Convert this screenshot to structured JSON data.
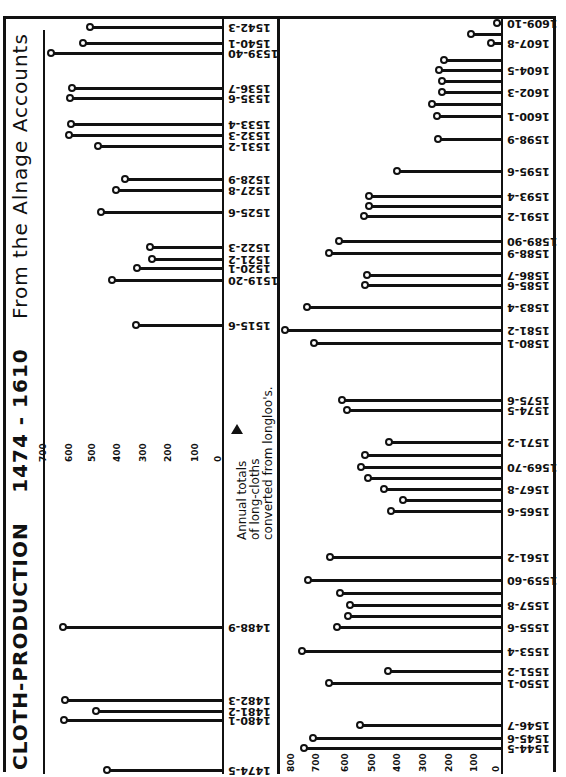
{
  "title": {
    "main": "CLOTH-PRODUCTION",
    "years": "1474 - 1610",
    "source": "From the Alnage Accounts"
  },
  "annotation": {
    "line1": "Annual totals",
    "line2": "of long-cloths",
    "line3": "converted from longloo's."
  },
  "chart_data": [
    {
      "type": "bar",
      "orientation": "lollipop, rotated 90°",
      "title": "CLOTH-PRODUCTION 1474-1610 From the Alnage Accounts",
      "panel": "left (1474-1543)",
      "xlabel": "",
      "ylabel": "Annual totals of long-cloths converted from longloo's",
      "ylim": [
        0,
        700
      ],
      "ticks": [
        "0",
        "100",
        "200",
        "300",
        "400",
        "500",
        "600",
        "700"
      ],
      "grid": false,
      "categories": [
        "1474-5",
        "1480-1",
        "1481-2",
        "1482-3",
        "1488-9",
        "1515-6",
        "1519-20",
        "1520-1",
        "1521-2",
        "1522-3",
        "1525-6",
        "1527-8",
        "1528-9",
        "1531-2",
        "1532-3",
        "1533-4",
        "1535-6",
        "1536-7",
        "1539-40",
        "1540-1",
        "1542-3"
      ],
      "values": [
        452,
        624,
        496,
        620,
        628,
        336,
        432,
        332,
        272,
        280,
        476,
        416,
        380,
        488,
        604,
        596,
        600,
        592,
        676,
        548,
        520
      ]
    },
    {
      "type": "bar",
      "orientation": "lollipop, rotated 90°",
      "panel": "right (1544-1610)",
      "ylim": [
        0,
        800
      ],
      "ticks": [
        "0",
        "100",
        "200",
        "300",
        "400",
        "500",
        "600",
        "700",
        "800"
      ],
      "grid": false,
      "categories": [
        "1544-5",
        "1545-6",
        "1546-7",
        "1550-1",
        "1551-2",
        "1553-4",
        "1555-6",
        "1556-7",
        "1557-8",
        "1558-9",
        "1559-60",
        "1561-2",
        "1565-6",
        "1566-7",
        "1567-8",
        "1568-9",
        "1569-70",
        "1570-1",
        "1571-2",
        "1574-5",
        "1575-6",
        "1580-1",
        "1581-2",
        "1583-4",
        "1585-6",
        "1586-7",
        "1588-9",
        "1589-90",
        "1591-2",
        "1592-3",
        "1593-4",
        "1595-6",
        "1598-9",
        "1600-1",
        "1601-2",
        "1602-3",
        "1603-4",
        "1604-5",
        "1606-7",
        "1607-8",
        "1608-9",
        "1609-10"
      ],
      "values": [
        755,
        715,
        535,
        655,
        425,
        760,
        625,
        580,
        575,
        610,
        735,
        650,
        415,
        365,
        440,
        505,
        530,
        515,
        420,
        585,
        605,
        715,
        825,
        740,
        515,
        505,
        655,
        615,
        520,
        500,
        500,
        390,
        230,
        235,
        255,
        215,
        215,
        225,
        205,
        25,
        100,
        5
      ]
    }
  ],
  "left_panel": {
    "ticks": [
      "700",
      "600",
      "500",
      "400",
      "300",
      "200",
      "100",
      "0"
    ],
    "rows": [
      {
        "label": "1542-3",
        "y": 27,
        "x": 90
      },
      {
        "label": "1540-1",
        "y": 43,
        "x": 83
      },
      {
        "label": "1539-40",
        "y": 53,
        "x": 51
      },
      {
        "label": "1536-7",
        "y": 88,
        "x": 72
      },
      {
        "label": "1535-6",
        "y": 98,
        "x": 70
      },
      {
        "label": "1533-4",
        "y": 124,
        "x": 71
      },
      {
        "label": "1532-3",
        "y": 135,
        "x": 69
      },
      {
        "label": "1531-2",
        "y": 146,
        "x": 98
      },
      {
        "label": "1528-9",
        "y": 179,
        "x": 125
      },
      {
        "label": "1527-8",
        "y": 190,
        "x": 116
      },
      {
        "label": "1525-6",
        "y": 212,
        "x": 101
      },
      {
        "label": "1522-3",
        "y": 247,
        "x": 150
      },
      {
        "label": "1521-2",
        "y": 259,
        "x": 152
      },
      {
        "label": "1520-1",
        "y": 268,
        "x": 137
      },
      {
        "label": "1519-20",
        "y": 280,
        "x": 112
      },
      {
        "label": "1515-6",
        "y": 325,
        "x": 136
      },
      {
        "label": "1488-9",
        "y": 627,
        "x": 63
      },
      {
        "label": "1482-3",
        "y": 700,
        "x": 65
      },
      {
        "label": "1481-2",
        "y": 711,
        "x": 96
      },
      {
        "label": "1480-1",
        "y": 720,
        "x": 64
      },
      {
        "label": "1474-5",
        "y": 770,
        "x": 107
      }
    ]
  },
  "right_panel": {
    "ticks": [
      "800",
      "700",
      "600",
      "500",
      "400",
      "300",
      "200",
      "100",
      "0"
    ],
    "rows": [
      {
        "label": "1609-10",
        "y": 23,
        "x": 497
      },
      {
        "label": "",
        "y": 34,
        "x": 471
      },
      {
        "label": "1607-8",
        "y": 43,
        "x": 491
      },
      {
        "label": "",
        "y": 60,
        "x": 444
      },
      {
        "label": "1604-5",
        "y": 70,
        "x": 439
      },
      {
        "label": "",
        "y": 81,
        "x": 442
      },
      {
        "label": "1602-3",
        "y": 92,
        "x": 442
      },
      {
        "label": "",
        "y": 104,
        "x": 432
      },
      {
        "label": "1600-1",
        "y": 116,
        "x": 437
      },
      {
        "label": "1598-9",
        "y": 139,
        "x": 438
      },
      {
        "label": "1595-6",
        "y": 171,
        "x": 397
      },
      {
        "label": "1593-4",
        "y": 196,
        "x": 369
      },
      {
        "label": "",
        "y": 206,
        "x": 369
      },
      {
        "label": "1591-2",
        "y": 216,
        "x": 364
      },
      {
        "label": "1589-90",
        "y": 241,
        "x": 339
      },
      {
        "label": "1588-9",
        "y": 253,
        "x": 329
      },
      {
        "label": "1586-7",
        "y": 275,
        "x": 367
      },
      {
        "label": "1585-6",
        "y": 285,
        "x": 365
      },
      {
        "label": "1583-4",
        "y": 307,
        "x": 307
      },
      {
        "label": "1581-2",
        "y": 330,
        "x": 285
      },
      {
        "label": "1580-1",
        "y": 343,
        "x": 314
      },
      {
        "label": "1575-6",
        "y": 400,
        "x": 342
      },
      {
        "label": "1574-5",
        "y": 410,
        "x": 347
      },
      {
        "label": "1571-2",
        "y": 442,
        "x": 389
      },
      {
        "label": "",
        "y": 455,
        "x": 365
      },
      {
        "label": "1569-70",
        "y": 467,
        "x": 361
      },
      {
        "label": "",
        "y": 478,
        "x": 368
      },
      {
        "label": "1567-8",
        "y": 489,
        "x": 384
      },
      {
        "label": "",
        "y": 500,
        "x": 403
      },
      {
        "label": "1565-6",
        "y": 511,
        "x": 391
      },
      {
        "label": "1561-2",
        "y": 557,
        "x": 330
      },
      {
        "label": "1559-60",
        "y": 580,
        "x": 308
      },
      {
        "label": "",
        "y": 593,
        "x": 340
      },
      {
        "label": "1557-8",
        "y": 605,
        "x": 350
      },
      {
        "label": "",
        "y": 616,
        "x": 348
      },
      {
        "label": "1555-6",
        "y": 627,
        "x": 337
      },
      {
        "label": "1553-4",
        "y": 651,
        "x": 302
      },
      {
        "label": "1551-2",
        "y": 671,
        "x": 388
      },
      {
        "label": "1550-1",
        "y": 683,
        "x": 329
      },
      {
        "label": "1546-7",
        "y": 725,
        "x": 360
      },
      {
        "label": "1545-6",
        "y": 738,
        "x": 313
      },
      {
        "label": "1544-5",
        "y": 748,
        "x": 304
      }
    ]
  }
}
